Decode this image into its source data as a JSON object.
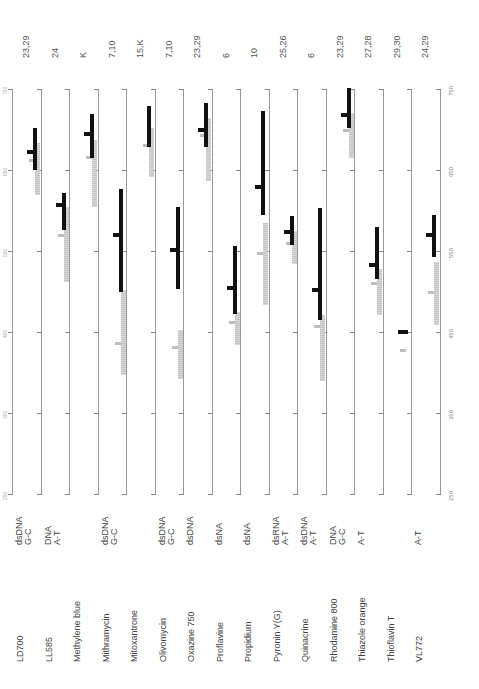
{
  "chart_data": {
    "type": "range-bar",
    "title": "",
    "orientation": "rotated -90deg (wavelength axis vertical, 750 at top)",
    "axis": {
      "label": "wavelength (nm)",
      "range": [
        250,
        750
      ],
      "ticks": [
        250,
        350,
        450,
        550,
        650,
        750
      ],
      "tick_labels": [
        "250",
        "350",
        "450",
        "550",
        "650",
        "750"
      ]
    },
    "legend": {
      "black_bar": "emission range (peak marked)",
      "gray_bar": "absorption/excitation range (peak marked)"
    },
    "series": [
      {
        "name": "LD700",
        "specificity": [
          "dsDNA",
          "G-C"
        ],
        "refs": "23,29",
        "emission": [
          650,
          702
        ],
        "emission_peak": 672,
        "absorption": [
          619,
          683
        ],
        "absorption_peak": 662
      },
      {
        "name": "LL585",
        "specificity": [
          "DNA",
          "A-T"
        ],
        "refs": "24",
        "emission": [
          576,
          622
        ],
        "emission_peak": 607,
        "absorption": [
          512,
          604
        ],
        "absorption_peak": 570
      },
      {
        "name": "Methylene blue",
        "specificity": [],
        "refs": "K",
        "emission": [
          665,
          719
        ],
        "emission_peak": 694,
        "absorption": [
          604,
          687
        ],
        "absorption_peak": 666
      },
      {
        "name": "Mithramycin",
        "specificity": [
          "dsDNA",
          "G-C"
        ],
        "refs": "7,10",
        "emission": [
          499,
          627
        ],
        "emission_peak": 570,
        "absorption": [
          397,
          502
        ],
        "absorption_peak": 436
      },
      {
        "name": "Mitoxantrone",
        "specificity": [],
        "refs": "15,K",
        "emission": [
          678,
          729
        ],
        "emission_peak": null,
        "absorption": [
          641,
          702
        ],
        "absorption_peak": 681
      },
      {
        "name": "Olivomycin",
        "specificity": [
          "dsDNA",
          "G-C"
        ],
        "refs": "7,10",
        "emission": [
          503,
          604
        ],
        "emission_peak": 551,
        "absorption": [
          392,
          452
        ],
        "absorption_peak": 431
      },
      {
        "name": "Oxazine 750",
        "specificity": [
          "dsDNA"
        ],
        "refs": "23,29",
        "emission": [
          678,
          733
        ],
        "emission_peak": 699,
        "absorption": [
          636,
          714
        ],
        "absorption_peak": 693
      },
      {
        "name": "Proflavine",
        "specificity": [
          "dsNA"
        ],
        "refs": "6",
        "emission": [
          472,
          556
        ],
        "emission_peak": 504,
        "absorption": [
          434,
          475
        ],
        "absorption_peak": 462
      },
      {
        "name": "Propidium",
        "specificity": [
          "dsNA"
        ],
        "refs": "10",
        "emission": [
          594,
          723
        ],
        "emission_peak": 629,
        "absorption": [
          483,
          584
        ],
        "absorption_peak": 547
      },
      {
        "name": "Pyronin Y(G)",
        "specificity": [
          "dsRNA",
          "A-T"
        ],
        "refs": "25,26",
        "emission": [
          557,
          593
        ],
        "emission_peak": 573,
        "absorption": [
          534,
          575
        ],
        "absorption_peak": 560
      },
      {
        "name": "Quinacrine",
        "specificity": [
          "dsDNA",
          "A-T"
        ],
        "refs": "6",
        "emission": [
          465,
          603
        ],
        "emission_peak": 502,
        "absorption": [
          390,
          471
        ],
        "absorption_peak": 457
      },
      {
        "name": "Rhodamine 800",
        "specificity": [
          "DNA",
          "G-C"
        ],
        "refs": "23,29",
        "emission": [
          702,
          751
        ],
        "emission_peak": 718,
        "absorption": [
          665,
          720
        ],
        "absorption_peak": 699
      },
      {
        "name": "Thiazole orange",
        "specificity": [
          "A-T"
        ],
        "refs": "27,28",
        "emission": [
          516,
          580
        ],
        "emission_peak": 533,
        "absorption": [
          471,
          528
        ],
        "absorption_peak": 510
      },
      {
        "name": "Thioflavin T",
        "specificity": [],
        "refs": "29,30",
        "emission": [
          447,
          452
        ],
        "emission_peak": 450,
        "absorption": null,
        "absorption_peak": 428
      },
      {
        "name": "VL772",
        "specificity": [
          "A-T"
        ],
        "refs": "24,29",
        "emission": [
          543,
          594
        ],
        "emission_peak": 570,
        "absorption": [
          459,
          536
        ],
        "absorption_peak": 499
      }
    ]
  },
  "labels": {
    "dyes": [
      "LD700",
      "LL585",
      "Methylene blue",
      "Mithramycin",
      "Mitoxantrone",
      "Olivomycin",
      "Oxazine 750",
      "Proflavine",
      "Propidium",
      "Pyronin Y(G)",
      "Quinacrine",
      "Rhodamine 800",
      "Thiazole orange",
      "Thioflavin T",
      "VL772"
    ],
    "specificity_line1": [
      "dsDNA",
      "DNA",
      "",
      "dsDNA",
      "",
      "dsDNA",
      "dsDNA",
      "dsNA",
      "dsNA",
      "dsRNA",
      "dsDNA",
      "DNA",
      "A-T",
      "",
      "A-T"
    ],
    "specificity_line2": [
      "G-C",
      "A-T",
      "",
      "G-C",
      "",
      "G-C",
      "",
      "",
      "",
      "A-T",
      "A-T",
      "G-C",
      "",
      "",
      ""
    ],
    "refs": [
      "23,29",
      "24",
      "K",
      "7,10",
      "15,K",
      "7,10",
      "23,29",
      "6",
      "10",
      "25,26",
      "6",
      "23,29",
      "27,28",
      "29,30",
      "24,29"
    ],
    "axis_right": [
      "750",
      "650",
      "550",
      "450",
      "350",
      "250"
    ],
    "axis_left": [
      "750",
      "650",
      "550",
      "450",
      "350",
      "250"
    ]
  }
}
